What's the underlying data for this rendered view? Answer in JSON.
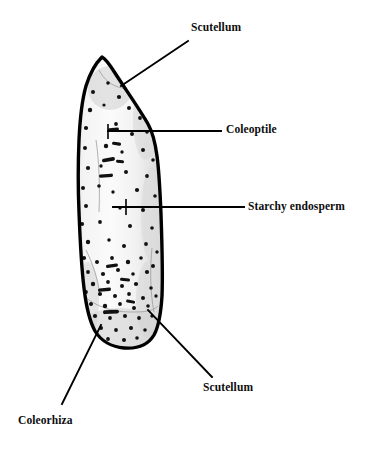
{
  "figure": {
    "background_color": "#ffffff",
    "width": 369,
    "height": 452
  },
  "seed": {
    "outline_color": "#000000",
    "fill_color": "#f1f1f1",
    "shading_color": "#d8d8d8",
    "speckle_color": "#111111",
    "description": "pointed-apex cereal grain in longitudinal section with speckled aleurone and endosperm"
  },
  "labels": [
    {
      "id": "scutellum-top",
      "text": "Scutellum",
      "leader": "diagonal",
      "points_to": "upper region of grain near apex"
    },
    {
      "id": "coleoptile",
      "text": "Coleoptile",
      "leader": "horizontal",
      "points_to": "upper middle interior of grain"
    },
    {
      "id": "starchy-endosperm",
      "text": "Starchy endosperm",
      "leader": "horizontal",
      "points_to": "central interior of grain"
    },
    {
      "id": "scutellum-bottom",
      "text": "Scutellum",
      "leader": "diagonal",
      "points_to": "lower right region of grain"
    },
    {
      "id": "coleorhiza",
      "text": "Coleorhiza",
      "leader": "diagonal",
      "points_to": "lower left base of grain"
    }
  ]
}
